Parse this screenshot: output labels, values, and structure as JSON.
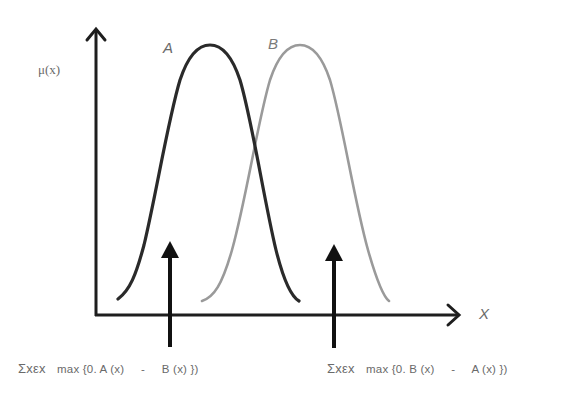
{
  "diagram": {
    "title": "",
    "y_axis_label": "μ(x)",
    "x_axis_label": "X",
    "curves": [
      {
        "name": "A",
        "label": "A",
        "color": "#2a2a2a",
        "peak_x": 210,
        "left_x": 118,
        "right_x": 299
      },
      {
        "name": "B",
        "label": "B",
        "color": "#9a9a9a",
        "peak_x": 300,
        "left_x": 202,
        "right_x": 389
      }
    ],
    "annotations": [
      {
        "name": "left-difference",
        "sum_symbol": "Σxεx",
        "expression": "max {0. A (x)",
        "minus": "-",
        "tail": "B (x) })",
        "arrow_x": 170
      },
      {
        "name": "right-difference",
        "sum_symbol": "Σxεx",
        "expression": "max {0. B (x)",
        "minus": "-",
        "tail": "A (x) })",
        "arrow_x": 333
      }
    ],
    "colors": {
      "axis": "#1e1e1e",
      "curve_a": "#2a2a2a",
      "curve_b": "#9a9a9a",
      "arrow": "#111111",
      "text": "#6a6a6a"
    }
  }
}
